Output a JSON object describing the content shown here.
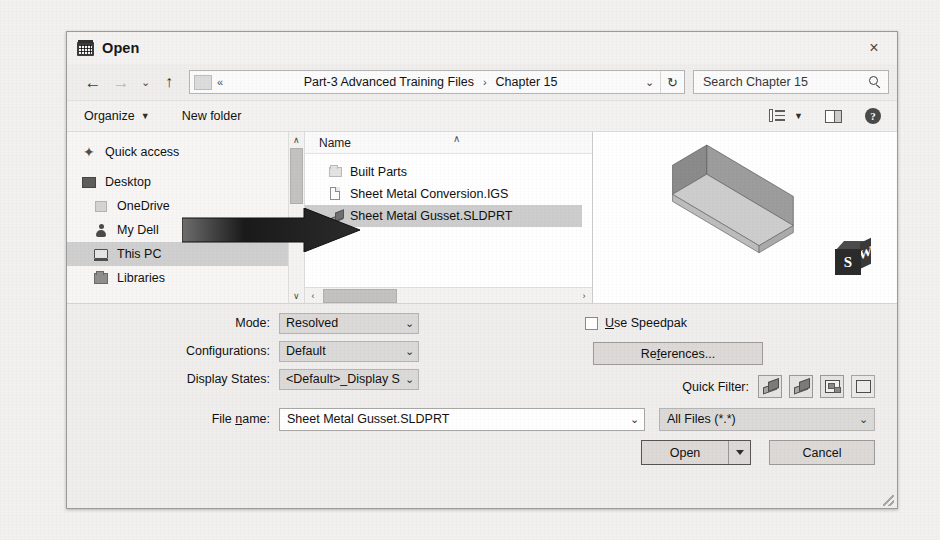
{
  "window": {
    "title": "Open",
    "app_icon": "computer-window-icon",
    "close_label": "×"
  },
  "navbar": {
    "back_icon": "←",
    "forward_icon": "→",
    "recent_icon": "⌄",
    "up_icon": "↑",
    "address": {
      "chevrons": "«",
      "crumbs": [
        "Part-3 Advanced Training Files",
        "Chapter 15"
      ],
      "separator": "›",
      "dropdown_icon": "⌄",
      "refresh_icon": "↻"
    },
    "search": {
      "value": "Search Chapter 15",
      "placeholder": "Search Chapter 15",
      "icon": "search-icon"
    }
  },
  "commandbar": {
    "organize_label": "Organize",
    "organize_caret": "▼",
    "new_folder_label": "New folder",
    "view_icon": "view-layout-icon",
    "view_caret": "▼",
    "preview_pane_icon": "preview-pane-icon",
    "help_icon": "?"
  },
  "navpane": {
    "items": [
      {
        "label": "Quick access",
        "icon": "pin-icon",
        "selected": false,
        "indent": false
      },
      {
        "label": "Desktop",
        "icon": "desktop-icon",
        "selected": false,
        "indent": false
      },
      {
        "label": "OneDrive",
        "icon": "cloud-icon",
        "selected": false,
        "indent": true
      },
      {
        "label": "My Dell",
        "icon": "user-icon",
        "selected": false,
        "indent": true
      },
      {
        "label": "This PC",
        "icon": "computer-icon",
        "selected": true,
        "indent": true
      },
      {
        "label": "Libraries",
        "icon": "library-icon",
        "selected": false,
        "indent": true
      }
    ],
    "scroll_up": "∧",
    "scroll_down": "∨"
  },
  "filelist": {
    "column_header": "Name",
    "sort_caret": "∧",
    "items": [
      {
        "label": "Built Parts",
        "icon": "folder-icon",
        "selected": false
      },
      {
        "label": "Sheet Metal Conversion.IGS",
        "icon": "document-icon",
        "selected": false
      },
      {
        "label": "Sheet Metal Gusset.SLDPRT",
        "icon": "part-icon",
        "selected": true
      }
    ],
    "scroll_left": "‹",
    "scroll_right": "›"
  },
  "preview": {
    "model_name": "sheet-metal-gusset-preview",
    "logo_front": "S",
    "logo_side": "W"
  },
  "options": {
    "rows": [
      {
        "label": "Mode:",
        "value": "Resolved"
      },
      {
        "label": "Configurations:",
        "value": "Default"
      },
      {
        "label": "Display States:",
        "value": "<Default>_Display St"
      }
    ],
    "caret": "⌄",
    "speedpak": {
      "label": "Use Speedpak",
      "accesskey": "U",
      "checked": false
    },
    "references_label": "References..."
  },
  "quick_filter": {
    "label": "Quick Filter:",
    "buttons": [
      "filter-parts-icon",
      "filter-assemblies-icon",
      "filter-drawings-icon",
      "filter-top-level-icon"
    ]
  },
  "filename": {
    "label_before": "File ",
    "label_accesskey": "n",
    "label_after": "ame:",
    "value": "Sheet Metal Gusset.SLDPRT",
    "caret": "⌄"
  },
  "filetype": {
    "value": "All Files (*.*)",
    "caret": "⌄"
  },
  "actions": {
    "open_label": "Open",
    "open_split_icon": "chevron-down-icon",
    "cancel_label": "Cancel"
  },
  "annotation": {
    "arrow": "pointer-arrow-right",
    "target": "Sheet Metal Gusset.SLDPRT"
  },
  "colors": {
    "dialog_bg": "#f0eeec",
    "list_bg": "#ffffff",
    "selection": "#cdcdcd",
    "page_bg": "#f2f1ef"
  }
}
